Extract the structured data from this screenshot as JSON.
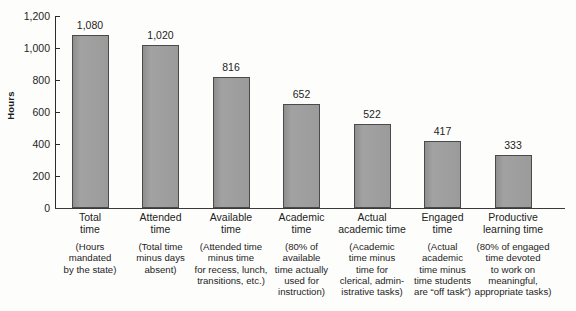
{
  "chart_data": {
    "type": "bar",
    "title": "",
    "subtitle": "",
    "xlabel": "",
    "ylabel": "Hours",
    "ylim": [
      0,
      1200
    ],
    "grid": false,
    "legend": false,
    "y_ticks": [
      "0",
      "200",
      "400",
      "600",
      "800",
      "1,000",
      "1,200"
    ],
    "y_tick_values": [
      0,
      200,
      400,
      600,
      800,
      1000,
      1200
    ],
    "categories": [
      "Total\ntime",
      "Attended\ntime",
      "Available\ntime",
      "Academic\ntime",
      "Actual\nacademic time",
      "Engaged\ntime",
      "Productive\nlearning time"
    ],
    "category_descriptions": [
      "(Hours\nmandated\nby the state)",
      "(Total time\nminus days\nabsent)",
      "(Attended time\nminus time\nfor recess, lunch,\ntransitions, etc.)",
      "(80% of\navailable\ntime actually\nused for\ninstruction)",
      "(Academic\ntime minus\ntime for\nclerical, admin-\nistrative tasks)",
      "(Actual\nacademic\ntime minus\ntime students\nare “off task”)",
      "(80% of engaged\ntime devoted\nto work on\nmeaningful,\nappropriate tasks)"
    ],
    "values": [
      1080,
      1020,
      816,
      652,
      522,
      417,
      333
    ],
    "value_labels": [
      "1,080",
      "1,020",
      "816",
      "652",
      "522",
      "417",
      "333"
    ],
    "colors": {
      "bar_fill": "#9a9a9a",
      "bar_stroke": "#4a4a4a",
      "axis": "#2b2b2b",
      "text": "#1d1d1d",
      "background": "#fdfdfc"
    }
  }
}
